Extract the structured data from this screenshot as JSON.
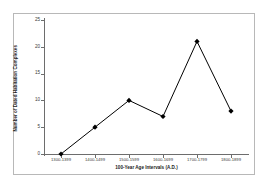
{
  "chart_data": {
    "type": "line",
    "title": "",
    "xlabel": "100-Year Age Intervals (A.D.)",
    "ylabel": "Number of Dated Habitation Complexes",
    "categories": [
      "1300-1399",
      "1400-1499",
      "1500-1599",
      "1600-1699",
      "1700-1799",
      "1800-1899"
    ],
    "values": [
      0,
      5,
      10,
      7,
      21,
      8
    ],
    "ylim": [
      0,
      25
    ],
    "yticks": [
      0,
      5,
      10,
      15,
      20,
      25
    ],
    "ytick_labels": [
      "0",
      "5",
      "10",
      "15",
      "20",
      "25"
    ],
    "grid": false,
    "legend": false,
    "marker": "diamond",
    "line_color": "#000000",
    "marker_color": "#000000",
    "axis_color": "#6d6d6d",
    "frame_color": "#b8b8b8",
    "background_color": "#ffffff"
  }
}
